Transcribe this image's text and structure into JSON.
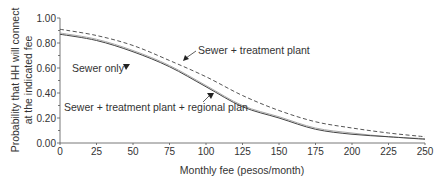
{
  "chart_data": {
    "type": "line",
    "title": "",
    "xlabel": "Monthly fee (pesos/month)",
    "ylabel_line1": "Probability that HH will connect",
    "ylabel_line2": "at the indicated fee",
    "ylabel": "Probability that HH will connect at the indicated fee",
    "xlim": [
      0,
      250
    ],
    "ylim": [
      0,
      1.0
    ],
    "x_ticks": [
      0,
      25,
      50,
      75,
      100,
      125,
      150,
      175,
      200,
      225,
      250
    ],
    "x_tick_labels": [
      "0",
      "25",
      "50",
      "75",
      "100",
      "125",
      "150",
      "175",
      "200",
      "225",
      "250"
    ],
    "y_ticks": [
      0,
      0.2,
      0.4,
      0.6,
      0.8,
      1.0
    ],
    "y_tick_labels": [
      "0.00",
      "0.20",
      "0.40",
      "0.60",
      "0.80",
      "1.00"
    ],
    "grid": false,
    "legend": "inline annotations",
    "x": [
      0,
      25,
      50,
      75,
      100,
      125,
      150,
      175,
      200,
      225,
      250
    ],
    "series": [
      {
        "name": "Sewer + treatment plant",
        "style": "dashed",
        "color": "#555555",
        "values": [
          0.91,
          0.86,
          0.78,
          0.66,
          0.53,
          0.38,
          0.26,
          0.17,
          0.12,
          0.08,
          0.05
        ]
      },
      {
        "name": "Sewer only",
        "style": "solid-light",
        "color": "#aaaaaa",
        "values": [
          0.88,
          0.83,
          0.74,
          0.62,
          0.46,
          0.3,
          0.21,
          0.12,
          0.08,
          0.05,
          0.035
        ]
      },
      {
        "name": "Sewer + treatment plant + regional plan",
        "style": "solid",
        "color": "#444444",
        "values": [
          0.87,
          0.82,
          0.73,
          0.61,
          0.45,
          0.29,
          0.2,
          0.11,
          0.07,
          0.05,
          0.03
        ]
      }
    ],
    "annotations": [
      {
        "text": "Sewer + treatment plant",
        "series": "Sewer + treatment plant"
      },
      {
        "text": "Sewer only",
        "series": "Sewer only"
      },
      {
        "text": "Sewer + treatment plant + regional plan",
        "series": "Sewer + treatment plant + regional plan"
      }
    ]
  }
}
